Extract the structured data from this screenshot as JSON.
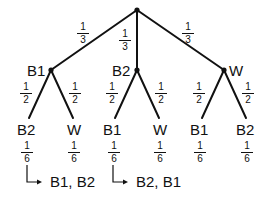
{
  "diagram": {
    "type": "probability-tree",
    "root": {
      "x": 137,
      "y": 10
    },
    "level1": [
      {
        "label": "B1",
        "prob_num": "1",
        "prob_den": "3"
      },
      {
        "label": "B2",
        "prob_num": "1",
        "prob_den": "3"
      },
      {
        "label": "W",
        "prob_num": "1",
        "prob_den": "3"
      }
    ],
    "level2": [
      {
        "parent": "B1",
        "label": "B2",
        "branch_num": "1",
        "branch_den": "2",
        "joint_num": "1",
        "joint_den": "6"
      },
      {
        "parent": "B1",
        "label": "W",
        "branch_num": "1",
        "branch_den": "2",
        "joint_num": "1",
        "joint_den": "6"
      },
      {
        "parent": "B2",
        "label": "B1",
        "branch_num": "1",
        "branch_den": "2",
        "joint_num": "1",
        "joint_den": "6"
      },
      {
        "parent": "B2",
        "label": "W",
        "branch_num": "1",
        "branch_den": "2",
        "joint_num": "1",
        "joint_den": "6"
      },
      {
        "parent": "W",
        "label": "B1",
        "branch_num": "1",
        "branch_den": "2",
        "joint_num": "1",
        "joint_den": "6"
      },
      {
        "parent": "W",
        "label": "B2",
        "branch_num": "1",
        "branch_den": "2",
        "joint_num": "1",
        "joint_den": "6"
      }
    ],
    "outcomes": [
      {
        "from_leaf": 0,
        "text": "B1, B2"
      },
      {
        "from_leaf": 2,
        "text": "B2, B1"
      }
    ],
    "colors": {
      "stroke": "#111111",
      "background": "#ffffff"
    }
  }
}
